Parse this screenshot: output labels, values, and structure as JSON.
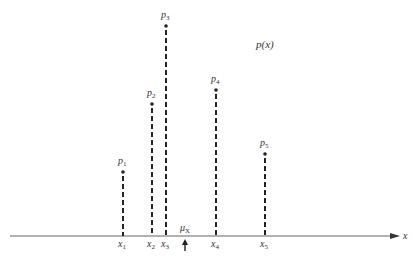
{
  "diagram": {
    "title": "p(x)",
    "axis": {
      "label": "x",
      "y": 236,
      "x_start": 10,
      "x_end": 400,
      "color": "#666666"
    },
    "mean": {
      "label_main": "μ",
      "label_sub": "X",
      "x": 185
    },
    "stems": [
      {
        "name": "x1",
        "x_label_main": "x",
        "x_label_sub": "1",
        "p_label_main": "p",
        "p_label_sub": "1",
        "x": 123,
        "top": 172
      },
      {
        "name": "x2",
        "x_label_main": "x",
        "x_label_sub": "2",
        "p_label_main": "p",
        "p_label_sub": "2",
        "x": 152,
        "top": 104
      },
      {
        "name": "x3",
        "x_label_main": "x",
        "x_label_sub": "3",
        "p_label_main": "p",
        "p_label_sub": "3",
        "x": 166,
        "top": 26
      },
      {
        "name": "x4",
        "x_label_main": "x",
        "x_label_sub": "4",
        "p_label_main": "p",
        "p_label_sub": "4",
        "x": 216,
        "top": 90
      },
      {
        "name": "x5",
        "x_label_main": "x",
        "x_label_sub": "5",
        "p_label_main": "p",
        "p_label_sub": "5",
        "x": 265,
        "top": 154
      }
    ],
    "colors": {
      "ink": "#222222",
      "axis": "#666666",
      "text": "#333333"
    }
  }
}
